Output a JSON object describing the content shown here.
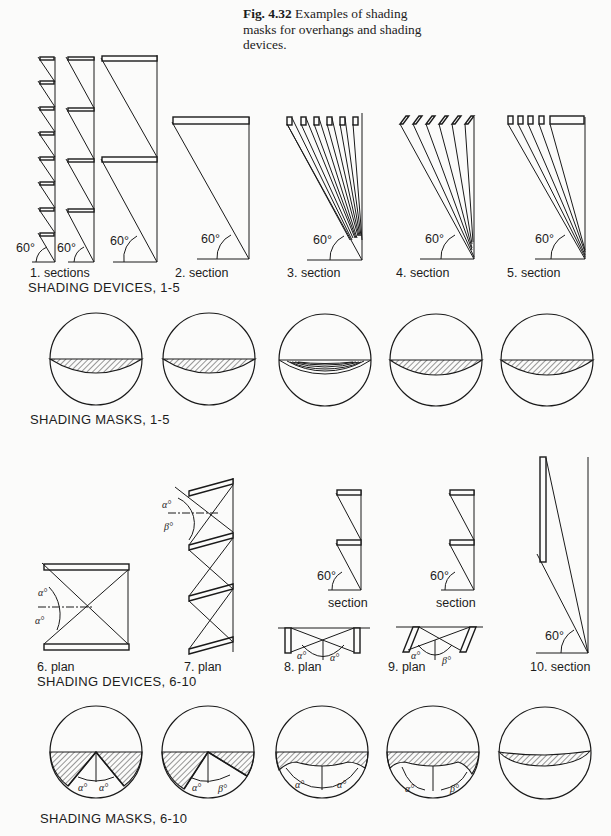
{
  "caption": {
    "fig_number": "Fig. 4.32",
    "text": "Examples of shading masks for overhangs and shading devices."
  },
  "angle_label": "60°",
  "greek": {
    "alpha": "α°",
    "beta": "β°"
  },
  "devices_1_5": {
    "group_title": "SHADING DEVICES, 1-5",
    "labels": [
      "1.  sections",
      "2.  section",
      "3.  section",
      "4.  section",
      "5.  section"
    ]
  },
  "masks_1_5": {
    "group_title": "SHADING MASKS, 1-5"
  },
  "devices_6_10": {
    "group_title": "SHADING DEVICES, 6-10",
    "labels": [
      "6.  plan",
      "7.  plan",
      "8.  plan",
      "9.  plan",
      "10.  section"
    ],
    "sub_labels": [
      "section",
      "section"
    ]
  },
  "masks_6_10": {
    "group_title": "SHADING MASKS, 6-10"
  }
}
